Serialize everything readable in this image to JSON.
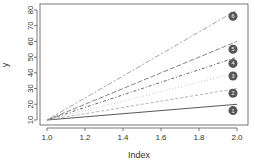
{
  "chart_data": {
    "type": "line",
    "title": "",
    "xlabel": "Index",
    "ylabel": "y",
    "xlim": [
      1.0,
      2.0
    ],
    "ylim": [
      10,
      80
    ],
    "x_ticks": [
      "1.0",
      "1.2",
      "1.4",
      "1.6",
      "1.8",
      "2.0"
    ],
    "y_ticks": [
      "10",
      "20",
      "30",
      "40",
      "50",
      "60",
      "70",
      "80"
    ],
    "grid": false,
    "legend": "numbered markers at line ends",
    "x": [
      1,
      2
    ],
    "series": [
      {
        "name": "1",
        "values": [
          10,
          20
        ],
        "style": "solid",
        "color": "#444444"
      },
      {
        "name": "2",
        "values": [
          10,
          30
        ],
        "style": "dashed",
        "color": "#aaaaaa"
      },
      {
        "name": "3",
        "values": [
          10,
          40
        ],
        "style": "dotted",
        "color": "#bbbbbb"
      },
      {
        "name": "4",
        "values": [
          10,
          50
        ],
        "style": "dotdash",
        "color": "#555555"
      },
      {
        "name": "5",
        "values": [
          10,
          60
        ],
        "style": "longdash",
        "color": "#777777"
      },
      {
        "name": "6",
        "values": [
          10,
          80
        ],
        "style": "twodash",
        "color": "#999999"
      }
    ],
    "markers": [
      {
        "label": "1",
        "y": 16
      },
      {
        "label": "2",
        "y": 27
      },
      {
        "label": "3",
        "y": 38
      },
      {
        "label": "4",
        "y": 46
      },
      {
        "label": "5",
        "y": 55
      },
      {
        "label": "6",
        "y": 76
      }
    ]
  }
}
